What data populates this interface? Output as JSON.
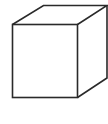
{
  "figure": {
    "stroke_color": "#2a2a2a",
    "background_color": "#ffffff",
    "caption": ""
  }
}
